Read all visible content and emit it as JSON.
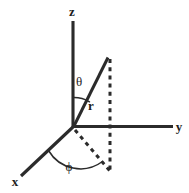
{
  "figure": {
    "background_color": "#ffffff",
    "ink_color": "#2b2b2b",
    "width": 189,
    "height": 193
  },
  "axes": [
    {
      "id": "z",
      "label": "z",
      "label_x": 72,
      "label_y": 16,
      "from": {
        "x": 73,
        "y": 21
      },
      "to": {
        "x": 73,
        "y": 127
      },
      "style": "solid"
    },
    {
      "id": "y",
      "label": "y",
      "label_x": 179,
      "label_y": 131,
      "from": {
        "x": 73,
        "y": 126
      },
      "to": {
        "x": 173,
        "y": 126
      },
      "style": "solid"
    },
    {
      "id": "x",
      "label": "x",
      "label_x": 15,
      "label_y": 186,
      "from": {
        "x": 73,
        "y": 127
      },
      "to": {
        "x": 21,
        "y": 176
      },
      "style": "solid"
    }
  ],
  "origin": {
    "x": 73,
    "y": 127
  },
  "radius_vector": {
    "label": "r",
    "label_x": 91,
    "label_y": 110,
    "from": {
      "x": 73,
      "y": 127
    },
    "to": {
      "x": 108,
      "y": 58
    },
    "style": "solid"
  },
  "projection_lines": [
    {
      "id": "vertical-projection",
      "description": "dashed vertical drop from r tip to xy-plane",
      "from": {
        "x": 110,
        "y": 59
      },
      "to": {
        "x": 110,
        "y": 171
      },
      "style": "dashed"
    },
    {
      "id": "ground-projection",
      "description": "dashed line in xy-plane from origin to projected point",
      "from": {
        "x": 74,
        "y": 129
      },
      "to": {
        "x": 110,
        "y": 171
      },
      "style": "dashed"
    }
  ],
  "angles": [
    {
      "id": "theta",
      "label": "θ",
      "label_x": 78,
      "label_y": 85,
      "description": "polar angle between z-axis and radius vector",
      "arc_radius": 30,
      "arc_path": "M 73 97 A 30 30 0 0 1 89 102"
    },
    {
      "id": "phi",
      "label": "ϕ",
      "label_x": 68,
      "label_y": 170,
      "description": "azimuthal angle between x-axis and ground projection",
      "arc_radius": 34,
      "arc_path": "M 49 150 A 36 36 0 0 0 102 163"
    }
  ]
}
